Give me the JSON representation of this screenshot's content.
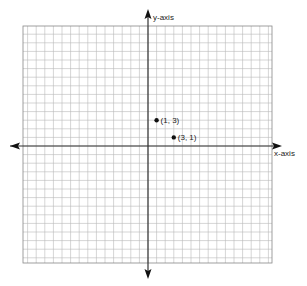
{
  "chart_data": {
    "type": "scatter",
    "title": "",
    "xlabel": "x-axis",
    "ylabel": "y-axis",
    "grid": true,
    "xlim": [
      -14.5,
      14.5
    ],
    "ylim": [
      -13.5,
      14
    ],
    "points": [
      {
        "x": 1,
        "y": 3,
        "label": "(1, 3)"
      },
      {
        "x": 3,
        "y": 1,
        "label": "(3, 1)"
      }
    ],
    "legend": null
  },
  "layout": {
    "grid_left": 23,
    "grid_top": 26,
    "grid_right": 272,
    "grid_bottom": 263,
    "origin_x": 148,
    "origin_y": 146,
    "cell": 8.6,
    "grid_color": "#b8b8b8",
    "axis_color": "#333333",
    "point_color": "#111111"
  }
}
